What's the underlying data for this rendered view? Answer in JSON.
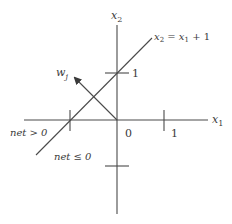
{
  "diagram": {
    "axes": {
      "x_label": "x",
      "x_sub": "1",
      "y_label": "x",
      "y_sub": "2"
    },
    "ticks": {
      "origin": "0",
      "x_one": "1",
      "y_one": "1"
    },
    "boundary": {
      "eq_lhs": "x",
      "eq_lhs_sub": "2",
      "eq_mid": " = x",
      "eq_mid_sub": "1",
      "eq_rhs": " + 1"
    },
    "weight": {
      "label": "w",
      "sub": "j"
    },
    "regions": {
      "positive": "net > 0",
      "nonpositive": "net ≤ 0"
    },
    "colors": {
      "line": "#4a4a4a",
      "text": "#3a3a3a",
      "background": "#ffffff"
    }
  }
}
